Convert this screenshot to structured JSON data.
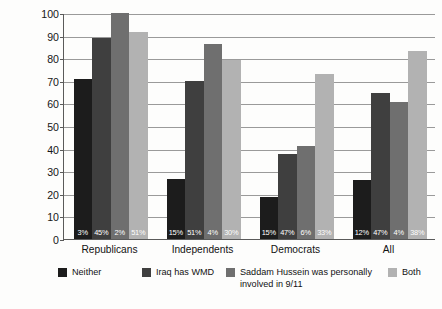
{
  "chart_data": {
    "type": "bar",
    "title": "",
    "subtitle": "",
    "xlabel": "",
    "ylabel": "Percent Approving Military Action\nto Remove Saddam Hussein",
    "ylim": [
      0,
      100
    ],
    "yticks": [
      0,
      10,
      20,
      30,
      40,
      50,
      60,
      70,
      80,
      90,
      100
    ],
    "ytick_labels": [
      "0",
      "10",
      "20",
      "30",
      "40",
      "50",
      "60",
      "70",
      "80",
      "90",
      "100"
    ],
    "grid": true,
    "legend_position": "bottom",
    "categories": [
      "Republicans",
      "Independents",
      "Democrats",
      "All"
    ],
    "series": [
      {
        "name": "Neither",
        "color": "#1c1c1c",
        "values": [
          71,
          26.5,
          18.5,
          26
        ],
        "data_labels": [
          "3%",
          "15%",
          "15%",
          "12%"
        ]
      },
      {
        "name": "Iraq has WMD",
        "color": "#3f3f3f",
        "values": [
          89,
          70,
          37.5,
          64.5
        ],
        "data_labels": [
          "45%",
          "51%",
          "47%",
          "47%"
        ]
      },
      {
        "name": "Saddam Hussein was personally\ninvolved in 9/11",
        "color": "#6f6f6f",
        "values": [
          100,
          86.5,
          41,
          60.5
        ],
        "data_labels": [
          "2%",
          "4%",
          "6%",
          "4%"
        ]
      },
      {
        "name": "Both",
        "color": "#b2b2b2",
        "values": [
          91.5,
          79,
          73,
          83
        ],
        "data_labels": [
          "51%",
          "30%",
          "33%",
          "38%"
        ]
      }
    ]
  }
}
